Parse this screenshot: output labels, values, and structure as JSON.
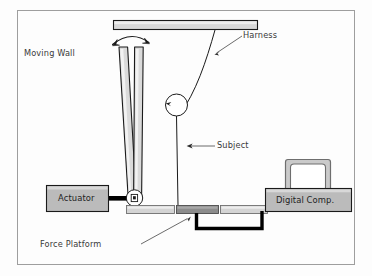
{
  "figure": {
    "type": "schematic-diagram",
    "subject_matter": "Moving wall postural perturbation experimental setup",
    "background_color": "#fdfdfd",
    "frame_color": "#9a9a9a",
    "line_color": "#1a1a1a",
    "fill_light": "#d6d6d6",
    "fill_mid": "#bcbcbc",
    "fill_dark": "#8a8a8a",
    "cable_color": "#000000"
  },
  "labels": {
    "moving_wall": "Moving Wall",
    "harness": "Harness",
    "subject": "Subject",
    "force_platform": "Force Platform",
    "actuator": "Actuator",
    "digital_comp": "Digital Comp."
  },
  "components": [
    {
      "name": "ceiling-beam",
      "label": "",
      "fill": "#d6d6d6"
    },
    {
      "name": "moving-wall",
      "label": "Moving Wall",
      "fill": "#d9d9d9"
    },
    {
      "name": "rotation-arrow",
      "label": "",
      "fill": "none"
    },
    {
      "name": "harness-cable",
      "label": "Harness",
      "fill": "none"
    },
    {
      "name": "subject-figure",
      "label": "Subject",
      "fill": "#ffffff"
    },
    {
      "name": "actuator-box",
      "label": "Actuator",
      "fill": "#b8b8b8"
    },
    {
      "name": "actuator-rod",
      "label": "",
      "fill": "#000000"
    },
    {
      "name": "pivot-joint",
      "label": "",
      "fill": "#ffffff"
    },
    {
      "name": "force-platform",
      "label": "Force Platform",
      "fill": "#d2d2d2"
    },
    {
      "name": "platform-active",
      "label": "",
      "fill": "#8a8a8a"
    },
    {
      "name": "data-cable",
      "label": "",
      "fill": "#000000"
    },
    {
      "name": "computer-box",
      "label": "Digital Comp.",
      "fill": "#b8b8b8"
    },
    {
      "name": "monitor",
      "label": "",
      "fill": "#c9c9c9"
    }
  ]
}
